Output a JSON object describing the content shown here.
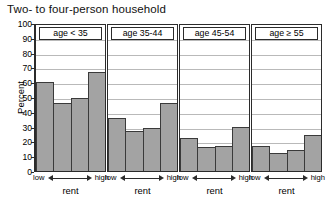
{
  "chart_data": {
    "type": "bar",
    "title": "Two- to four-person household",
    "xlabel": "rent",
    "ylabel": "Percent",
    "ylim": [
      0,
      100
    ],
    "yticks": [
      0,
      10,
      20,
      30,
      40,
      50,
      60,
      70,
      80,
      90,
      100
    ],
    "grid": true,
    "legend": "none",
    "x_axis_endpoint_labels": {
      "left": "low",
      "right": "high"
    },
    "categories": [
      "1",
      "2",
      "3",
      "4"
    ],
    "panels": [
      {
        "label": "age < 35",
        "values": [
          60,
          46,
          49,
          67
        ]
      },
      {
        "label": "age 35-44",
        "values": [
          36,
          27,
          29,
          46
        ]
      },
      {
        "label": "age 45-54",
        "values": [
          22,
          16,
          17,
          30
        ]
      },
      {
        "label": "age ≥ 55",
        "values": [
          17,
          12,
          14,
          24
        ]
      }
    ]
  },
  "colors": {
    "bar_fill": "#a3a3a3",
    "bar_edge": "#3a3a3a",
    "axis": "#2b2b2b",
    "gridline": "#b9b9b9",
    "background": "#ffffff"
  }
}
